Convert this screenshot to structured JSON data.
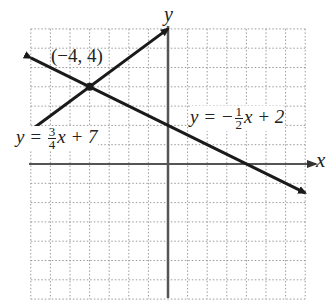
{
  "chart_data": {
    "type": "line",
    "title": "",
    "xlabel": "x",
    "ylabel": "y",
    "xlim": [
      -7,
      7
    ],
    "ylim": [
      -7,
      7
    ],
    "grid": true,
    "grid_style": "dotted",
    "grid_step": 1,
    "tick_labels": "none",
    "series": [
      {
        "name": "y = 3/4 x + 7",
        "equation": {
          "slope": 0.75,
          "intercept": 7
        },
        "x": [
          -7,
          0
        ],
        "y": [
          1.75,
          7
        ],
        "arrows": "both"
      },
      {
        "name": "y = -1/2 x + 2",
        "equation": {
          "slope": -0.5,
          "intercept": 2
        },
        "x": [
          -7,
          7
        ],
        "y": [
          5.5,
          -1.5
        ],
        "arrows": "both"
      }
    ],
    "annotations": [
      {
        "type": "point",
        "x": -4,
        "y": 4,
        "label": "(−4, 4)"
      }
    ]
  },
  "labels": {
    "x_axis": "x",
    "y_axis": "y",
    "intersection": "(−4, 4)",
    "line1": {
      "prefix": "y = ",
      "num": "3",
      "den": "4",
      "suffix": "x + 7"
    },
    "line2": {
      "prefix": "y = −",
      "num": "1",
      "den": "2",
      "suffix": "x + 2"
    }
  },
  "colors": {
    "line": "#1a1a1a",
    "axis": "#555555",
    "grid": "#9a9a9a",
    "background": "#ffffff"
  }
}
